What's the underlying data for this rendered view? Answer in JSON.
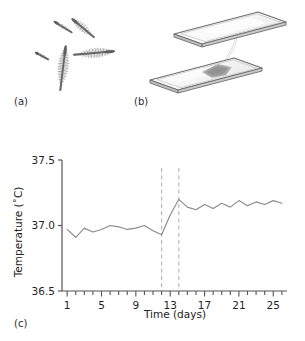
{
  "figure": {
    "panels": [
      {
        "key": "a",
        "label": "(a)",
        "caption_icon": "sperm-micrograph"
      },
      {
        "key": "b",
        "label": "(b)",
        "caption_icon": "microscope-slides"
      },
      {
        "key": "c",
        "label": "(c)",
        "caption_icon": "temperature-line-chart"
      }
    ]
  },
  "panel_a": {
    "label": "(a)",
    "description": "spermatozoa-micrograph",
    "cells": [
      {
        "name": "sperm-1",
        "cx": 63,
        "cy": 27,
        "len": 20,
        "rot": -58,
        "bristles": 12,
        "bristle_len": 1.6
      },
      {
        "name": "sperm-2",
        "cx": 83,
        "cy": 28,
        "len": 28,
        "rot": -50,
        "bristles": 22,
        "bristle_len": 3.2
      },
      {
        "name": "sperm-3",
        "cx": 42,
        "cy": 56,
        "len": 14,
        "rot": -62,
        "bristles": 8,
        "bristle_len": 1.4
      },
      {
        "name": "sperm-4",
        "cx": 63,
        "cy": 68,
        "len": 44,
        "rot": 7,
        "bristles": 34,
        "bristle_len": 4.6
      },
      {
        "name": "sperm-5",
        "cx": 94,
        "cy": 53,
        "len": 40,
        "rot": 85,
        "bristles": 30,
        "bristle_len": 4.2
      }
    ]
  },
  "panel_b": {
    "label": "(b)",
    "description": "two-glass-slides-with-sample-droplet",
    "slides": [
      {
        "name": "upper-slide",
        "has_droplet": false
      },
      {
        "name": "lower-slide",
        "has_droplet": true
      }
    ],
    "colors": {
      "slide_edge": "#6e6e6e",
      "slide_fill": "#f7f7f7",
      "slide_shade": "#e9e9e9",
      "droplet": "#9a9a9a"
    }
  },
  "chart_data": {
    "type": "line",
    "title": "",
    "xlabel": "Time (days)",
    "ylabel": "Temperature (˚C)",
    "xlim": [
      0.4,
      26.6
    ],
    "ylim": [
      36.5,
      37.5
    ],
    "yticks": [
      36.5,
      37.0,
      37.5
    ],
    "ytick_labels": [
      "36.5",
      "37.0",
      "37.5"
    ],
    "xticks": [
      1,
      2,
      3,
      4,
      5,
      6,
      7,
      8,
      9,
      10,
      11,
      12,
      13,
      14,
      15,
      16,
      17,
      18,
      19,
      20,
      21,
      22,
      23,
      24,
      25,
      26
    ],
    "xtick_labels_shown": [
      "1",
      "5",
      "9",
      "13",
      "17",
      "21",
      "25"
    ],
    "xtick_labeled_values": [
      1,
      5,
      9,
      13,
      17,
      21,
      25
    ],
    "grid": false,
    "legend": null,
    "line_color": "#8a8a8a",
    "series": [
      {
        "name": "basal-body-temperature",
        "x": [
          1,
          2,
          3,
          4,
          5,
          6,
          7,
          8,
          9,
          10,
          11,
          12,
          13,
          14,
          15,
          16,
          17,
          18,
          19,
          20,
          21,
          22,
          23,
          24,
          25,
          26
        ],
        "values": [
          36.97,
          36.91,
          36.98,
          36.95,
          36.97,
          37.0,
          36.99,
          36.97,
          36.98,
          37.0,
          36.96,
          36.93,
          37.08,
          37.2,
          37.14,
          37.12,
          37.16,
          37.13,
          37.17,
          37.14,
          37.19,
          37.15,
          37.18,
          37.16,
          37.19,
          37.17
        ]
      }
    ],
    "annotations": [
      {
        "name": "dashed-marker-1",
        "type": "vline",
        "x": 12.0,
        "style": "dashed",
        "color": "#b4b4b4"
      },
      {
        "name": "dashed-marker-2",
        "type": "vline",
        "x": 14.0,
        "style": "dashed",
        "color": "#b4b4b4"
      }
    ]
  }
}
